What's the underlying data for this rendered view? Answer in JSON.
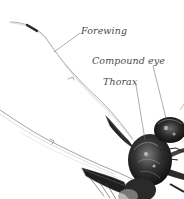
{
  "diagram": {
    "labels": [
      {
        "id": "forewing",
        "text": "Forewing"
      },
      {
        "id": "compound_eye",
        "text": "Compound eye"
      },
      {
        "id": "thorax",
        "text": "Thorax"
      }
    ],
    "colors": {
      "background": "#ffffff",
      "label_text": "#4a4a4a",
      "leader_line": "#666666",
      "body_dark": "#1a1a1a",
      "body_mid": "#555555",
      "wing_vein": "#8a8a8a"
    }
  }
}
